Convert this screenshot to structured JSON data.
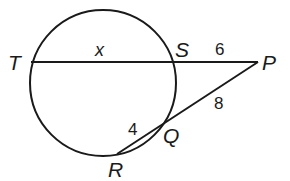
{
  "diagram": {
    "type": "circle-secant-diagram",
    "stroke_color": "#1a1a1a",
    "circle": {
      "cx": 103,
      "cy": 83,
      "r": 73
    },
    "points": {
      "T": {
        "label": "T",
        "x": 31,
        "y": 62
      },
      "S": {
        "label": "S",
        "x": 174,
        "y": 62
      },
      "P": {
        "label": "P",
        "x": 258,
        "y": 62
      },
      "Q": {
        "label": "Q",
        "x": 165,
        "y": 124
      },
      "R": {
        "label": "R",
        "x": 117,
        "y": 154
      }
    },
    "segments": {
      "TS": {
        "label": "x"
      },
      "SP": {
        "label": "6"
      },
      "RQ": {
        "label": "4"
      },
      "QP": {
        "label": "8"
      }
    }
  }
}
